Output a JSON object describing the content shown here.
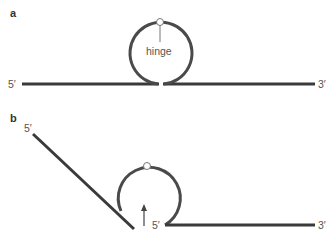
{
  "figure": {
    "panel_a": {
      "label": "a",
      "left_end": "5′",
      "right_end": "3′",
      "hinge_label": "hinge"
    },
    "panel_b": {
      "label": "b",
      "top_end": "5′",
      "inner_end": "5′",
      "right_end": "3′"
    }
  },
  "colors": {
    "strand": "#3a3a3a",
    "loop": "#4a4a4a",
    "hinge_stroke": "#777777",
    "text": "#555555"
  }
}
